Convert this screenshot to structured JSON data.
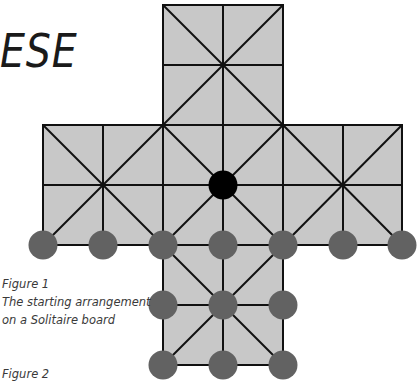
{
  "title_fragment": "ESE",
  "figure1": {
    "label": "Figure 1",
    "caption_line1": "The starting arrangement",
    "caption_line2": "on a Solitaire board"
  },
  "figure2": {
    "label": "Figure 2"
  },
  "board": {
    "fill_color": "#c8c8c8",
    "line_color": "#111111",
    "grid_spacing": 60,
    "columns_x": [
      43,
      103,
      163,
      223,
      283,
      343,
      402
    ],
    "rows_y": [
      5,
      65,
      125,
      185,
      245,
      305,
      365
    ],
    "pegs_grey": [
      [
        43,
        245
      ],
      [
        103,
        245
      ],
      [
        163,
        245
      ],
      [
        223,
        245
      ],
      [
        283,
        245
      ],
      [
        343,
        245
      ],
      [
        402,
        245
      ],
      [
        163,
        305
      ],
      [
        223,
        305
      ],
      [
        283,
        305
      ],
      [
        163,
        365
      ],
      [
        223,
        365
      ],
      [
        283,
        365
      ]
    ],
    "pegs_black": [
      [
        223,
        185
      ]
    ],
    "peg_colors": {
      "grey": "#626262",
      "black": "#000000"
    }
  }
}
